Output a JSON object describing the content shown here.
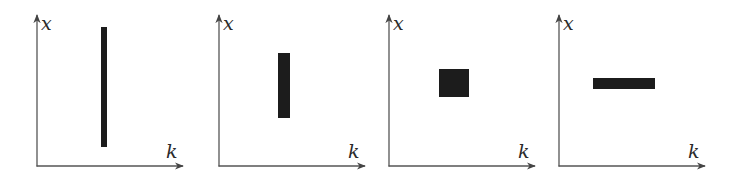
{
  "figure": {
    "axis_color": "#555555",
    "tile_color": "#1c1c1c",
    "panels": [
      {
        "id": "panel-1",
        "x_axis_label": "k",
        "y_axis_label": "x",
        "origin": [
          37,
          166
        ],
        "x_axis_end": 183,
        "y_axis_top": 15,
        "tile": {
          "x": 101,
          "y": 27,
          "width": 6,
          "height": 120
        },
        "shape": "tall-narrow"
      },
      {
        "id": "panel-2",
        "x_axis_label": "k",
        "y_axis_label": "x",
        "origin": [
          219,
          166
        ],
        "x_axis_end": 365,
        "y_axis_top": 15,
        "tile": {
          "x": 278,
          "y": 53,
          "width": 12,
          "height": 65
        },
        "shape": "tall"
      },
      {
        "id": "panel-3",
        "x_axis_label": "k",
        "y_axis_label": "x",
        "origin": [
          389,
          166
        ],
        "x_axis_end": 535,
        "y_axis_top": 15,
        "tile": {
          "x": 439,
          "y": 69,
          "width": 30,
          "height": 28
        },
        "shape": "square"
      },
      {
        "id": "panel-4",
        "x_axis_label": "k",
        "y_axis_label": "x",
        "origin": [
          559,
          166
        ],
        "x_axis_end": 705,
        "y_axis_top": 15,
        "tile": {
          "x": 593,
          "y": 78,
          "width": 62,
          "height": 11
        },
        "shape": "wide-short"
      }
    ]
  }
}
